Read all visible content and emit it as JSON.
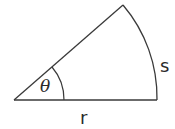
{
  "diagram": {
    "labels": {
      "arc_length": "s",
      "radius": "r",
      "angle": "θ"
    },
    "geometry": {
      "vertex": [
        14,
        100
      ],
      "radius_px": 143,
      "angle_deg": 41.4,
      "angle_marker_radius_px": 50
    },
    "colors": {
      "stroke": "#3a3a3a",
      "text": "#2a2a2a",
      "background": "#ffffff"
    }
  }
}
